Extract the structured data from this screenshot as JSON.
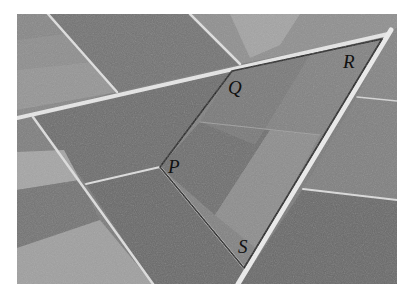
{
  "figure": {
    "vertices": [
      {
        "label": "P",
        "x": 160,
        "y": 167
      },
      {
        "label": "Q",
        "x": 232,
        "y": 71
      },
      {
        "label": "R",
        "x": 382,
        "y": 39
      },
      {
        "label": "S",
        "x": 244,
        "y": 268
      }
    ],
    "labels": {
      "P": "P",
      "Q": "Q",
      "R": "R",
      "S": "S"
    }
  }
}
